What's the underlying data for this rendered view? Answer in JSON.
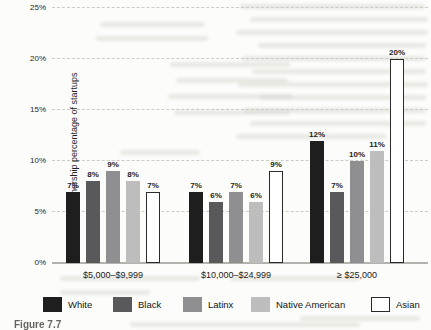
{
  "figure": {
    "caption": "Figure 7.7"
  },
  "chart_data": {
    "type": "bar",
    "title": "",
    "xlabel": "",
    "ylabel": "Ownership percentage of startups",
    "ylim": [
      0,
      25
    ],
    "yticks": [
      0,
      5,
      10,
      15,
      20,
      25
    ],
    "ytick_suffix": "%",
    "grid": "horizontal-dashed",
    "legend_position": "bottom",
    "categories": [
      "$5,000–$9,999",
      "$10,000–$24,999",
      "≥ $25,000"
    ],
    "series": [
      {
        "name": "White",
        "color": "#1e1e1e",
        "border": "#1e1e1e",
        "values": [
          7,
          7,
          12
        ]
      },
      {
        "name": "Black",
        "color": "#59595b",
        "border": "#59595b",
        "values": [
          8,
          6,
          7
        ]
      },
      {
        "name": "Latinx",
        "color": "#8f8f91",
        "border": "#8f8f91",
        "values": [
          9,
          7,
          10
        ]
      },
      {
        "name": "Native American",
        "color": "#bdbdbd",
        "border": "#bdbdbd",
        "values": [
          8,
          6,
          11
        ]
      },
      {
        "name": "Asian",
        "color": "#ffffff",
        "border": "#2a2a2a",
        "values": [
          7,
          9,
          20
        ]
      }
    ],
    "value_label_suffix": "%"
  }
}
